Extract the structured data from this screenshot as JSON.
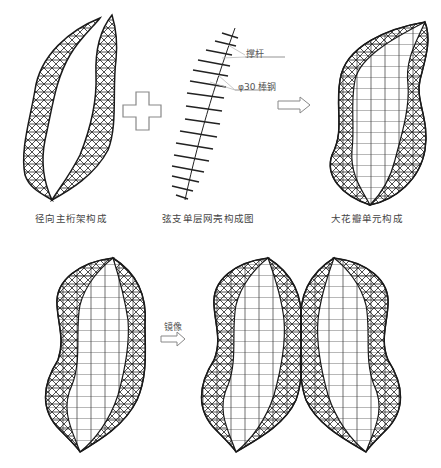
{
  "diagram": {
    "top_row": {
      "panel_1": {
        "caption": "径向主桁架构成"
      },
      "operator_plus": {
        "symbol": "plus"
      },
      "panel_2": {
        "caption": "弦支单层网壳构成图",
        "annotations": [
          {
            "label": "撑杆"
          },
          {
            "label": "φ30 棒钢"
          }
        ]
      },
      "operator_arrow": {
        "symbol": "arrow-right"
      },
      "panel_3": {
        "caption": "大花瓣单元构成"
      }
    },
    "bottom_row": {
      "panel_left": {
        "caption": ""
      },
      "operator_mirror": {
        "label": "镜像",
        "symbol": "arrow-right"
      },
      "panel_right": {
        "caption": ""
      }
    },
    "colors": {
      "stroke": "#1a1a1a",
      "light_stroke": "#aaaaaa",
      "operator": "#888888",
      "text": "#444444"
    }
  }
}
